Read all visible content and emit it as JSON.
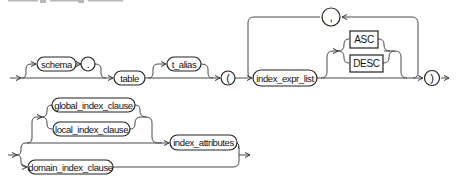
{
  "diagram": {
    "type": "railroad-syntax",
    "title_fragment_visible": true,
    "colors": {
      "line": "#4a4a4a",
      "outline": "#222222",
      "text": "#111111",
      "background": "#ffffff"
    },
    "row1": {
      "schema": "schema",
      "dot": ".",
      "table": "table",
      "t_alias": "t_alias",
      "open_paren": "(",
      "index_expr_list": "index_expr_list",
      "comma": ",",
      "asc": "ASC",
      "desc": "DESC",
      "close_paren": ")"
    },
    "row2": {
      "global_index_clause": "global_index_clause",
      "local_index_clause": "local_index_clause",
      "index_attributes": "index_attributes",
      "domain_index_clause": "domain_index_clause"
    }
  }
}
